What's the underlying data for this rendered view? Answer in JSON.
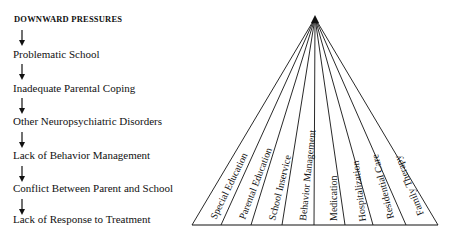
{
  "left_panel": {
    "title": "DOWNWARD PRESSURES",
    "items": [
      "Problematic School",
      "Inadequate Parental Coping",
      "Other Neuropsychiatric Disorders",
      "Lack of Behavior Management",
      "Conflict Between Parent and School",
      "Lack of Response to Treatment"
    ]
  },
  "fan": {
    "segments": [
      "Special Education",
      "Parental Education",
      "School Inservice",
      "Behavior Management",
      "Medication",
      "Hospitalization",
      "Residential Care",
      "Family Therapy"
    ]
  }
}
